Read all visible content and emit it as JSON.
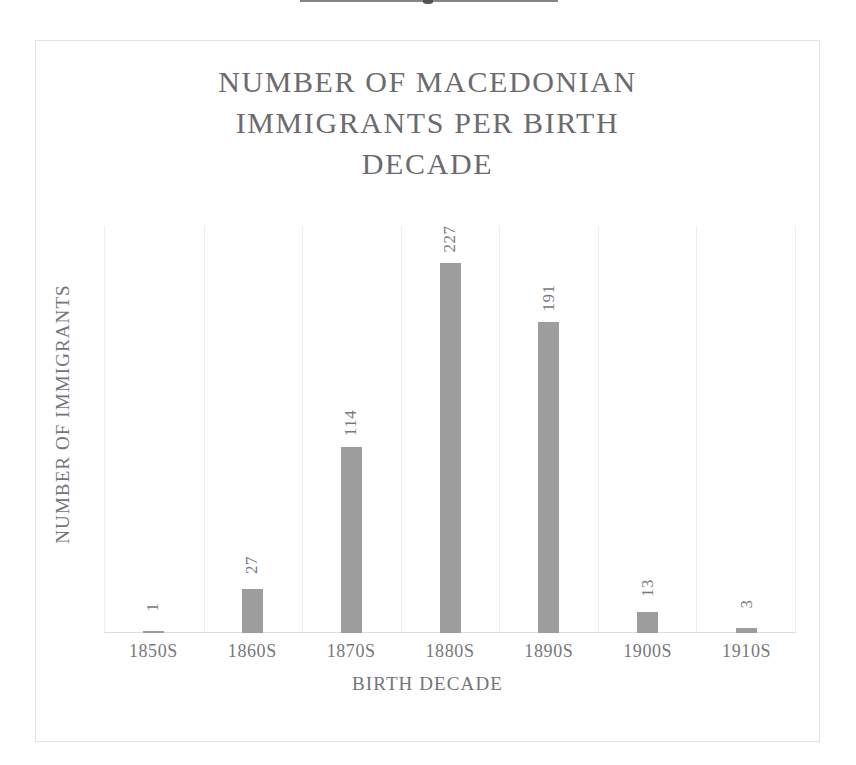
{
  "page": {
    "background_color": "#ffffff",
    "top_rule": "horizontal-rule-partial"
  },
  "chart_frame": {
    "border_color": "#e3e3e6",
    "background_color": "#ffffff"
  },
  "chart_data": {
    "type": "bar",
    "title": "NUMBER OF MACEDONIAN\nIMMIGRANTS PER BIRTH\nDECADE",
    "title_lines": [
      "NUMBER OF MACEDONIAN",
      "IMMIGRANTS PER BIRTH",
      "DECADE"
    ],
    "categories": [
      "1850S",
      "1860S",
      "1870S",
      "1880S",
      "1890S",
      "1900S",
      "1910S"
    ],
    "values": [
      1,
      27,
      114,
      227,
      191,
      13,
      3
    ],
    "labels": [
      "1",
      "27",
      "114",
      "227",
      "191",
      "13",
      "3"
    ],
    "xlabel": "BIRTH DECADE",
    "ylabel": "NUMBER OF IMMIGRANTS",
    "ylim": [
      0,
      250
    ],
    "axis_tick_labels_y": [],
    "grid": "vertical-category-separators",
    "legend": "none",
    "bar_color": "#9d9d9d",
    "text_color": "#74747a",
    "data_labels_rotated": true,
    "data_label_rotation_deg": -90
  }
}
